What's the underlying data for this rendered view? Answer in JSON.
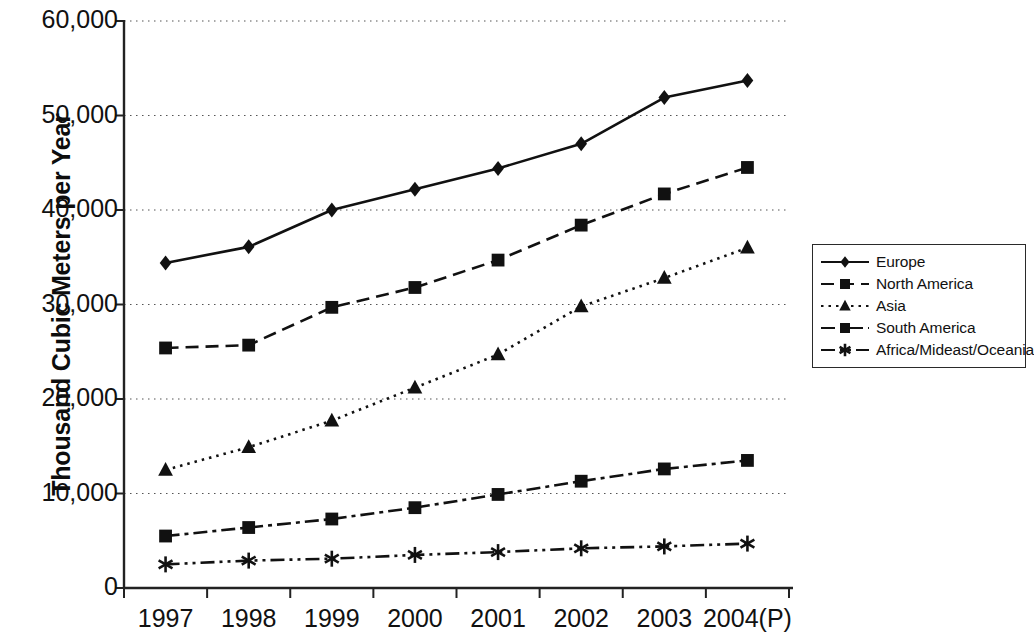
{
  "chart_data": {
    "type": "line",
    "title": "",
    "xlabel": "",
    "ylabel": "Thousand Cubic Meters per Year",
    "categories": [
      "1997",
      "1998",
      "1999",
      "2000",
      "2001",
      "2002",
      "2003",
      "2004(P)"
    ],
    "ylim": [
      0,
      60000
    ],
    "ytick_step": 10000,
    "ytick_labels": [
      "60,000",
      "50,000",
      "40,000",
      "30,000",
      "20,000",
      "10,000",
      "0"
    ],
    "ytick_values": [
      60000,
      50000,
      40000,
      30000,
      20000,
      10000,
      0
    ],
    "grid": true,
    "legend_position": "right",
    "series": [
      {
        "name": "Europe",
        "marker": "diamond",
        "dash": "solid",
        "color": "#111111",
        "values": [
          34400,
          36100,
          40000,
          42200,
          44400,
          47000,
          51900,
          53700
        ]
      },
      {
        "name": "North America",
        "marker": "square",
        "dash": "dashed",
        "color": "#111111",
        "values": [
          25400,
          25700,
          29700,
          31800,
          34700,
          38400,
          41700,
          44500
        ]
      },
      {
        "name": "Asia",
        "marker": "triangle",
        "dash": "dotted",
        "color": "#111111",
        "values": [
          12500,
          14900,
          17700,
          21200,
          24700,
          29800,
          32800,
          36000
        ]
      },
      {
        "name": "South America",
        "marker": "square",
        "dash": "dashdot",
        "color": "#111111",
        "values": [
          5500,
          6400,
          7300,
          8500,
          9900,
          11300,
          12600,
          13500
        ]
      },
      {
        "name": "Africa/Mideast/Oceania",
        "marker": "asterisk",
        "dash": "dashdotdot",
        "color": "#111111",
        "values": [
          2500,
          2900,
          3100,
          3500,
          3800,
          4200,
          4400,
          4700
        ]
      }
    ]
  }
}
